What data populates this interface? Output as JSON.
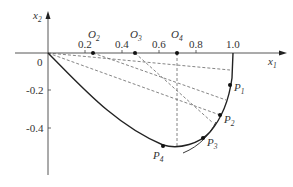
{
  "axes": {
    "x_label": "x",
    "x_sub": "1",
    "y_label": "x",
    "y_sub": "2",
    "origin_label": "0",
    "x_ticks": [
      "0.2",
      "0.4",
      "0.6",
      "0.8",
      "1.0"
    ],
    "y_ticks": [
      "-0.2",
      "-0.4"
    ]
  },
  "centers": [
    {
      "name": "O",
      "sub": "2",
      "x": 0.245
    },
    {
      "name": "O",
      "sub": "3",
      "x": 0.47
    },
    {
      "name": "O",
      "sub": "4",
      "x": 0.7
    }
  ],
  "points": [
    {
      "name": "P",
      "sub": "1",
      "x": 0.985,
      "y": -0.17
    },
    {
      "name": "P",
      "sub": "2",
      "x": 0.93,
      "y": -0.33
    },
    {
      "name": "P",
      "sub": "3",
      "x": 0.84,
      "y": -0.45
    },
    {
      "name": "P",
      "sub": "4",
      "x": 0.62,
      "y": -0.5
    }
  ],
  "colors": {
    "line": "#222222",
    "dash": "#666666",
    "axis": "#444444"
  }
}
